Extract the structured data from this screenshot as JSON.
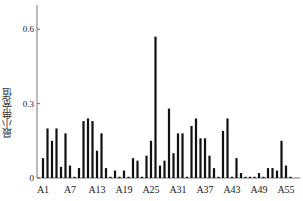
{
  "chart_data": {
    "type": "bar",
    "title": "",
    "xlabel": "",
    "ylabel": "最小带宽值",
    "ylim": [
      0,
      0.7
    ],
    "yticks": [
      0,
      0.3,
      0.6
    ],
    "ytick_labels": [
      "0",
      "0.3",
      "0.6"
    ],
    "xtick_labels": [
      "A1",
      "A7",
      "A13",
      "A19",
      "A25",
      "A31",
      "A37",
      "A43",
      "A49",
      "A55"
    ],
    "grid": false,
    "legend": null,
    "bar_color": "#111111",
    "categories": [
      "A1",
      "A2",
      "A3",
      "A4",
      "A5",
      "A6",
      "A7",
      "A8",
      "A9",
      "A10",
      "A11",
      "A12",
      "A13",
      "A14",
      "A15",
      "A16",
      "A17",
      "A18",
      "A19",
      "A20",
      "A21",
      "A22",
      "A23",
      "A24",
      "A25",
      "A26",
      "A27",
      "A28",
      "A29",
      "A30",
      "A31",
      "A32",
      "A33",
      "A34",
      "A35",
      "A36",
      "A37",
      "A38",
      "A39",
      "A40",
      "A41",
      "A42",
      "A43",
      "A44",
      "A45",
      "A46",
      "A47",
      "A48",
      "A49",
      "A50",
      "A51",
      "A52",
      "A53",
      "A54",
      "A55",
      "A56"
    ],
    "values": [
      0.08,
      0.2,
      0.15,
      0.2,
      0.045,
      0.18,
      0.05,
      0.005,
      0.04,
      0.23,
      0.24,
      0.23,
      0.11,
      0.18,
      0.04,
      0.005,
      0.03,
      0.005,
      0.03,
      0.005,
      0.08,
      0.07,
      0.005,
      0.09,
      0.15,
      0.57,
      0.05,
      0.07,
      0.28,
      0.1,
      0.18,
      0.18,
      0.005,
      0.21,
      0.24,
      0.16,
      0.16,
      0.09,
      0.04,
      0.005,
      0.19,
      0.24,
      0.005,
      0.08,
      0.02,
      0.005,
      0.005,
      0.005,
      0.02,
      0.005,
      0.04,
      0.04,
      0.03,
      0.15,
      0.05,
      0.005
    ]
  }
}
